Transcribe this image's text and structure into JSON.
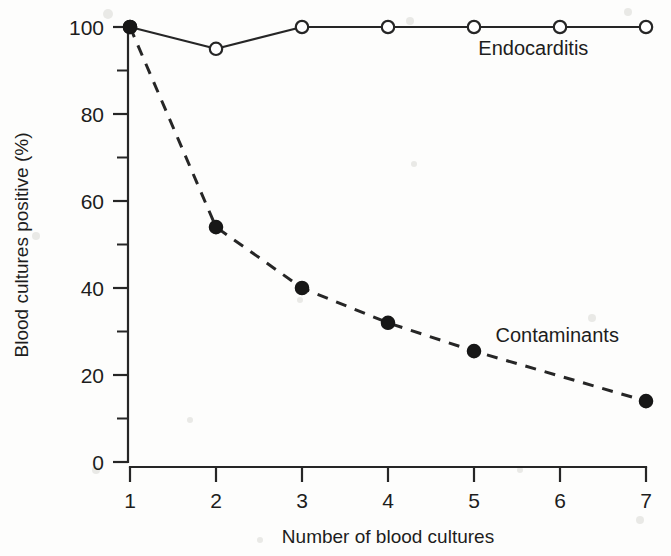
{
  "chart_data": {
    "type": "line",
    "title": "",
    "subtitle": "",
    "xlabel": "Number of blood cultures",
    "ylabel": "Blood cultures positive (%)",
    "x": [
      1,
      2,
      3,
      4,
      5,
      6,
      7
    ],
    "xticklabels": [
      "1",
      "2",
      "3",
      "4",
      "5",
      "6",
      "7"
    ],
    "yticklabels": [
      "0",
      "20",
      "40",
      "60",
      "80",
      "100"
    ],
    "yticks": [
      0,
      20,
      40,
      60,
      80,
      100
    ],
    "yminorticks": [
      10,
      30,
      50,
      70,
      90
    ],
    "xlim": [
      1,
      7
    ],
    "ylim": [
      0,
      100
    ],
    "grid": false,
    "legend_position": "inline-annotation",
    "series": [
      {
        "name": "Endocarditis",
        "marker": "open-circle",
        "linestyle": "solid",
        "color": "#262626",
        "x": [
          1,
          2,
          3,
          4,
          5,
          6,
          7
        ],
        "values": [
          100,
          95,
          100,
          100,
          100,
          100,
          100
        ],
        "annotation": "Endocarditis",
        "annotation_x": 5.05,
        "annotation_y": 93.5
      },
      {
        "name": "Contaminants",
        "marker": "filled-circle",
        "linestyle": "dashed",
        "color": "#171717",
        "x": [
          1,
          2,
          3,
          4,
          5,
          7
        ],
        "values": [
          100,
          54,
          40,
          32,
          25.5,
          14
        ],
        "annotation": "Contaminants",
        "annotation_x": 5.25,
        "annotation_y": 27.5
      }
    ],
    "annotations": [
      {
        "text": "Endocarditis",
        "x": 5.05,
        "y": 93.5
      },
      {
        "text": "Contaminants",
        "x": 5.25,
        "y": 27.5
      }
    ]
  }
}
